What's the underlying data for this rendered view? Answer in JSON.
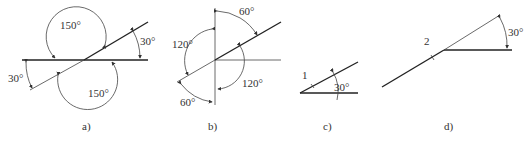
{
  "figure": {
    "panels": [
      {
        "id": "a",
        "caption": "a)",
        "angles": {
          "top": "150°",
          "bottom": "150°",
          "right": "30°",
          "left": "30°"
        }
      },
      {
        "id": "b",
        "caption": "b)",
        "angles": {
          "top": "60°",
          "left": "120°",
          "right": "120°",
          "bottom": "60°"
        }
      },
      {
        "id": "c",
        "caption": "c)",
        "line_label": "1",
        "angles": {
          "main": "30°"
        }
      },
      {
        "id": "d",
        "caption": "d)",
        "line_label": "2",
        "angles": {
          "main": "30°"
        }
      }
    ]
  }
}
